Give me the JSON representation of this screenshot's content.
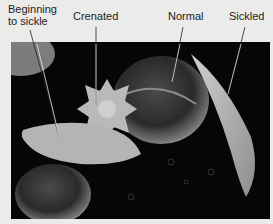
{
  "figure": {
    "labels": [
      {
        "id": "beginning-to-sickle",
        "text": "Beginning\nto sickle"
      },
      {
        "id": "crenated",
        "text": "Crenated"
      },
      {
        "id": "normal",
        "text": "Normal"
      },
      {
        "id": "sickled",
        "text": "Sickled"
      }
    ],
    "colors": {
      "background": "#ebebe9",
      "photo_background": "#060606",
      "cell": "#bdbdbd",
      "leader_line": "#e8e8e8"
    }
  }
}
